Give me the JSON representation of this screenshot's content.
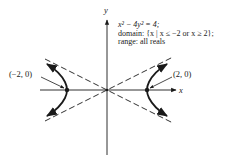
{
  "figure": {
    "type": "hyperbola-graph",
    "equation": "x² − 4y² = 4;",
    "domain_text": "domain: {x | x ≤ −2 or x ≥ 2};",
    "range_text": "range: all reals",
    "axes": {
      "x_label": "x",
      "y_label": "y"
    },
    "vertices": [
      {
        "label": "(−2, 0)",
        "x": -2,
        "y": 0
      },
      {
        "label": "(2, 0)",
        "x": 2,
        "y": 0
      }
    ],
    "asymptotes": [
      "y = x/2",
      "y = −x/2"
    ],
    "colors": {
      "ink": "#1a1a1a",
      "background": "#ffffff"
    }
  }
}
